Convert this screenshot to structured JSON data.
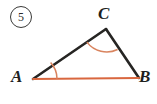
{
  "figure": {
    "problem_number": "5",
    "background_color": "#ffffff",
    "side_color_highlight": "#d9673f",
    "side_color_plain": "#262523",
    "arc_color": "#d9845f",
    "vertices": {
      "A": {
        "label": "A",
        "x": 33,
        "y": 79
      },
      "B": {
        "label": "B",
        "x": 139,
        "y": 78
      },
      "C": {
        "label": "C",
        "x": 106,
        "y": 29
      }
    },
    "segments": [
      {
        "name": "side-AC",
        "from": "A",
        "to": "C",
        "color": "#262523",
        "width": 2.6
      },
      {
        "name": "side-CB",
        "from": "C",
        "to": "B",
        "color": "#262523",
        "width": 2.6
      },
      {
        "name": "side-AB",
        "from": "A",
        "to": "B",
        "color": "#d9673f",
        "width": 2.2
      }
    ],
    "angle_marks": [
      {
        "name": "angle-arc-A",
        "vertex": "A",
        "color": "#d9845f",
        "radius": 24
      },
      {
        "name": "angle-arc-C",
        "vertex": "C",
        "color": "#d9845f",
        "radius": 25
      }
    ]
  }
}
